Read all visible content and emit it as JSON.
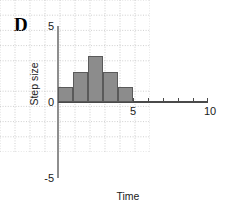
{
  "panel": {
    "letter": "D"
  },
  "chart_data": {
    "type": "bar",
    "title": "D",
    "xlabel": "Time",
    "ylabel": "Step size",
    "xlim": [
      0,
      10
    ],
    "ylim": [
      -5,
      5
    ],
    "grid": true,
    "legend": null,
    "x_tick_labels": [
      "5",
      "10"
    ],
    "x_tick_values": [
      5,
      10
    ],
    "x_ticks_all": [
      0,
      1,
      2,
      3,
      4,
      5,
      6,
      7,
      8,
      9,
      10
    ],
    "y_tick_labels": [
      "5",
      "0",
      "-5"
    ],
    "y_tick_values": [
      5,
      0,
      -5
    ],
    "bar_color": "#8c8c8c",
    "bar_edge_color": "#5a5a5a",
    "grid_color": "#c8c8c8",
    "axis_color": "#4a4a4a",
    "categories": [
      "0-1",
      "1-2",
      "2-3",
      "3-4",
      "4-5"
    ],
    "bin_edges": [
      0,
      1,
      2,
      3,
      4,
      5
    ],
    "values": [
      1,
      2,
      3,
      2,
      1
    ],
    "bars": [
      {
        "x_start": 0,
        "x_end": 1,
        "value": 1
      },
      {
        "x_start": 1,
        "x_end": 2,
        "value": 2
      },
      {
        "x_start": 2,
        "x_end": 3,
        "value": 3
      },
      {
        "x_start": 3,
        "x_end": 4,
        "value": 2
      },
      {
        "x_start": 4,
        "x_end": 5,
        "value": 1
      }
    ]
  }
}
